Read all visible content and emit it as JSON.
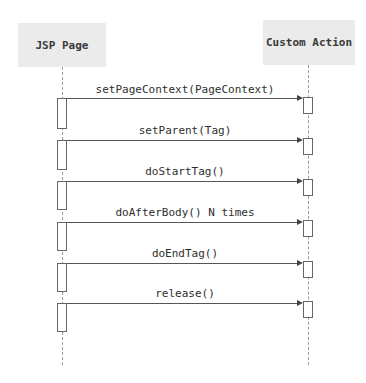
{
  "diagram": {
    "type": "sequence",
    "participants": [
      {
        "name": "JSP Page"
      },
      {
        "name": "Custom Action"
      }
    ],
    "messages": [
      {
        "label": "setPageContext(PageContext)",
        "from": "JSP Page",
        "to": "Custom Action"
      },
      {
        "label": "setParent(Tag)",
        "from": "JSP Page",
        "to": "Custom Action"
      },
      {
        "label": "doStartTag()",
        "from": "JSP Page",
        "to": "Custom Action"
      },
      {
        "label": "doAfterBody() N times",
        "from": "JSP Page",
        "to": "Custom Action"
      },
      {
        "label": "doEndTag()",
        "from": "JSP Page",
        "to": "Custom Action"
      },
      {
        "label": "release()",
        "from": "JSP Page",
        "to": "Custom Action"
      }
    ],
    "colors": {
      "participant_fill": "#ebebeb",
      "line": "#555555",
      "text": "#2e2e2e"
    }
  }
}
